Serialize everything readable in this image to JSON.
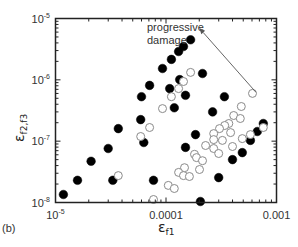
{
  "chart_data": {
    "type": "scatter",
    "panel_label": "(b)",
    "title": "",
    "xlabel": "ε",
    "xlabel_sub": "f1",
    "ylabel": "ε",
    "ylabel_sub": "f2,f3",
    "xscale": "log",
    "yscale": "log",
    "xlim": [
      1e-05,
      0.001
    ],
    "ylim": [
      1e-08,
      1e-05
    ],
    "grid": false,
    "x_ticks": [
      {
        "value": 1e-05,
        "label_base": "10",
        "label_exp": "-5"
      },
      {
        "value": 0.0001,
        "label_base": "0.0001",
        "label_exp": ""
      },
      {
        "value": 0.001,
        "label_base": "0.001",
        "label_exp": ""
      }
    ],
    "y_ticks": [
      {
        "value": 1e-08,
        "label_base": "10",
        "label_exp": "-8"
      },
      {
        "value": 1e-07,
        "label_base": "10",
        "label_exp": "-7"
      },
      {
        "value": 1e-06,
        "label_base": "10",
        "label_exp": "-6"
      },
      {
        "value": 1e-05,
        "label_base": "10",
        "label_exp": "-5"
      }
    ],
    "annotation": {
      "lines": [
        "progressive",
        "damage"
      ],
      "arrow_from": [
        0.00065,
        6.3e-07
      ],
      "arrow_to": [
        0.0002,
        7e-06
      ]
    },
    "series": [
      {
        "name": "filled",
        "marker": "filled-circle",
        "color": "#000000",
        "points": [
          [
            0.000167,
            4.5e-06
          ],
          [
            0.000144,
            3.5e-06
          ],
          [
            0.00013,
            2.9e-06
          ],
          [
            0.000112,
            2.15e-06
          ],
          [
            9.3e-05,
            1.53e-06
          ],
          [
            0.000214,
            1.27e-06
          ],
          [
            0.000133,
            1.01e-06
          ],
          [
            7.1e-05,
            8.1e-07
          ],
          [
            0.000108,
            7.2e-07
          ],
          [
            6e-05,
            5.3e-07
          ],
          [
            0.00015,
            5.6e-07
          ],
          [
            0.000338,
            5.3e-07
          ],
          [
            0.000119,
            3.5e-07
          ],
          [
            0.000264,
            3e-07
          ],
          [
            5.9e-05,
            2.25e-07
          ],
          [
            3.7e-05,
            1.6e-07
          ],
          [
            0.000185,
            1.28e-07
          ],
          [
            0.00076,
            1.94e-07
          ],
          [
            0.00067,
            1.44e-07
          ],
          [
            0.00058,
            1.03e-07
          ],
          [
            6.3e-05,
            9.5e-08
          ],
          [
            3e-05,
            7.6e-08
          ],
          [
            0.00015,
            7.9e-08
          ],
          [
            0.00049,
            6.5e-08
          ],
          [
            0.0004,
            5e-08
          ],
          [
            2.1e-05,
            4.7e-08
          ],
          [
            0.0003,
            2.55e-08
          ],
          [
            1.58e-05,
            2.3e-08
          ],
          [
            3.3e-05,
            2.3e-08
          ],
          [
            7.7e-05,
            2.3e-08
          ],
          [
            1.18e-05,
            1.35e-08
          ],
          [
            0.000205,
            1.04e-08
          ]
        ]
      },
      {
        "name": "open",
        "marker": "open-circle",
        "color": "#8a8a8a",
        "points": [
          [
            0.000167,
            1.32e-06
          ],
          [
            0.000144,
            9.4e-07
          ],
          [
            0.00013,
            7.2e-07
          ],
          [
            0.000112,
            5.3e-07
          ],
          [
            9.3e-05,
            3.4e-07
          ],
          [
            7.1e-05,
            1.67e-07
          ],
          [
            5.9e-05,
            1.19e-07
          ],
          [
            0.000607,
            6e-07
          ],
          [
            0.00048,
            3.67e-07
          ],
          [
            0.00041,
            2.62e-07
          ],
          [
            0.00047,
            2.34e-07
          ],
          [
            0.00037,
            1.94e-07
          ],
          [
            0.00034,
            1.8e-07
          ],
          [
            0.000305,
            1.6e-07
          ],
          [
            0.00027,
            1.33e-07
          ],
          [
            0.00076,
            1.67e-07
          ],
          [
            0.00058,
            1.28e-07
          ],
          [
            0.000384,
            1.38e-07
          ],
          [
            0.00049,
            1.1e-07
          ],
          [
            0.000324,
            1.03e-07
          ],
          [
            0.00027,
            1.06e-07
          ],
          [
            0.000228,
            8.5e-08
          ],
          [
            0.0004,
            8.2e-08
          ],
          [
            0.00027,
            7.6e-08
          ],
          [
            0.0003,
            6.3e-08
          ],
          [
            0.000181,
            6.1e-08
          ],
          [
            0.000189,
            5.4e-08
          ],
          [
            0.000214,
            4.8e-08
          ],
          [
            0.000201,
            3.45e-08
          ],
          [
            0.000147,
            3.7e-08
          ],
          [
            0.00013,
            3.1e-08
          ],
          [
            0.000144,
            2.75e-08
          ],
          [
            0.000163,
            2.65e-08
          ],
          [
            0.000105,
            1.9e-08
          ],
          [
            0.000119,
            1.69e-08
          ],
          [
            3.7e-05,
            2.75e-08
          ],
          [
            7.7e-05,
            1.12e-08
          ]
        ]
      }
    ]
  }
}
